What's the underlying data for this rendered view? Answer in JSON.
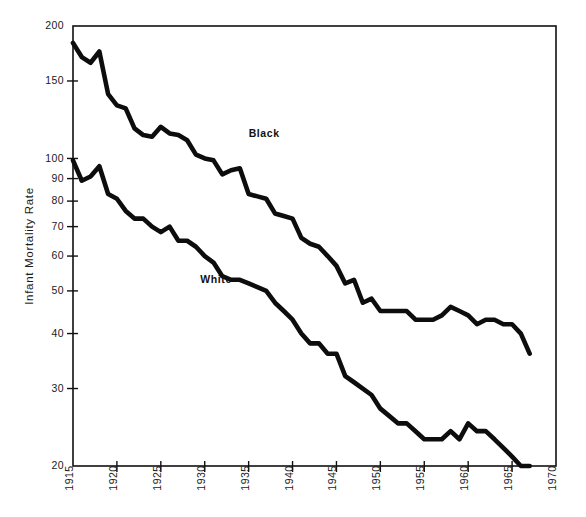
{
  "chart_data": {
    "type": "line",
    "title": "",
    "subtitle": "",
    "xlabel": "",
    "ylabel": "Infant Mortality Rate",
    "xlim": [
      1915,
      1970
    ],
    "ylim": [
      20,
      200
    ],
    "yscale": "log",
    "grid": false,
    "legend_position": "inline-labels",
    "x_ticks": [
      "1915",
      "1920",
      "1925",
      "1930",
      "1935",
      "1940",
      "1945",
      "1950",
      "1955",
      "1960",
      "1965",
      "1970"
    ],
    "x_tick_values": [
      1915,
      1920,
      1925,
      1930,
      1935,
      1940,
      1945,
      1950,
      1955,
      1960,
      1965,
      1970
    ],
    "y_ticks": [
      "20",
      "30",
      "40",
      "50",
      "60",
      "70",
      "80",
      "90",
      "100",
      "150",
      "200"
    ],
    "y_tick_values": [
      20,
      30,
      40,
      50,
      60,
      70,
      80,
      90,
      100,
      150,
      200
    ],
    "annotations": [
      {
        "text": "Black",
        "x": 1935.0,
        "y": 112.0
      },
      {
        "text": "White",
        "x": 1929.5,
        "y": 52.0
      }
    ],
    "series": [
      {
        "name": "Black",
        "label_text": "Black",
        "color": "#0d0d0d",
        "x": [
          1915,
          1916,
          1917,
          1918,
          1919,
          1920,
          1921,
          1922,
          1923,
          1924,
          1925,
          1926,
          1927,
          1928,
          1929,
          1930,
          1931,
          1932,
          1933,
          1934,
          1935,
          1936,
          1937,
          1938,
          1939,
          1940,
          1941,
          1942,
          1943,
          1944,
          1945,
          1946,
          1947,
          1948,
          1949,
          1950,
          1951,
          1952,
          1953,
          1954,
          1955,
          1956,
          1957,
          1958,
          1959,
          1960,
          1961,
          1962,
          1963,
          1964,
          1965,
          1966,
          1967
        ],
        "values": [
          183,
          170,
          165,
          175,
          140,
          132,
          130,
          117,
          113,
          112,
          118,
          114,
          113,
          110,
          102,
          100,
          99,
          92,
          94,
          95,
          83,
          82,
          81,
          75,
          74,
          73,
          66,
          64,
          63,
          60,
          57,
          52,
          53,
          47,
          48,
          45,
          45,
          45,
          45,
          43,
          43,
          43,
          44,
          46,
          45,
          44,
          42,
          43,
          43,
          42,
          42,
          40,
          36
        ]
      },
      {
        "name": "White",
        "label_text": "White",
        "color": "#0d0d0d",
        "x": [
          1915,
          1916,
          1917,
          1918,
          1919,
          1920,
          1921,
          1922,
          1923,
          1924,
          1925,
          1926,
          1927,
          1928,
          1929,
          1930,
          1931,
          1932,
          1933,
          1934,
          1935,
          1936,
          1937,
          1938,
          1939,
          1940,
          1941,
          1942,
          1943,
          1944,
          1945,
          1946,
          1947,
          1948,
          1949,
          1950,
          1951,
          1952,
          1953,
          1954,
          1955,
          1956,
          1957,
          1958,
          1959,
          1960,
          1961,
          1962,
          1963,
          1964,
          1965,
          1966,
          1967
        ],
        "values": [
          99,
          89,
          91,
          96,
          83,
          81,
          76,
          73,
          73,
          70,
          68,
          70,
          65,
          65,
          63,
          60,
          58,
          54,
          53,
          53,
          52,
          51,
          50,
          47,
          45,
          43,
          40,
          38,
          38,
          36,
          36,
          32,
          31,
          30,
          29,
          27,
          26,
          25,
          25,
          24,
          23,
          23,
          23,
          24,
          23,
          25,
          24,
          24,
          23,
          22,
          21,
          20,
          20
        ]
      }
    ]
  },
  "axis": {
    "y_title": "Infant Mortality Rate"
  }
}
